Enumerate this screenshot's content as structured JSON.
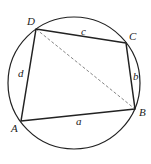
{
  "diagram": {
    "type": "cyclic-quadrilateral",
    "circle": {
      "cx": 74,
      "cy": 83,
      "r": 66
    },
    "vertices": {
      "A": {
        "label": "A",
        "x": 21,
        "y": 121,
        "lx": 11,
        "ly": 132
      },
      "B": {
        "label": "B",
        "x": 135,
        "y": 109,
        "lx": 139,
        "ly": 116
      },
      "C": {
        "label": "C",
        "x": 126,
        "y": 43,
        "lx": 129,
        "ly": 40
      },
      "D": {
        "label": "D",
        "x": 36,
        "y": 29,
        "lx": 27,
        "ly": 25
      }
    },
    "sides": {
      "a": {
        "label": "a",
        "from": "A",
        "to": "B",
        "lx": 76,
        "ly": 125
      },
      "b": {
        "label": "b",
        "from": "B",
        "to": "C",
        "lx": 133,
        "ly": 80
      },
      "c": {
        "label": "c",
        "from": "C",
        "to": "D",
        "lx": 81,
        "ly": 35
      },
      "d": {
        "label": "d",
        "from": "D",
        "to": "A",
        "lx": 18,
        "ly": 77
      }
    },
    "diagonal": {
      "from": "D",
      "to": "B",
      "style": "dashed"
    },
    "colors": {
      "stroke": "#222222",
      "dashed": "#777777",
      "background": "#ffffff"
    }
  }
}
